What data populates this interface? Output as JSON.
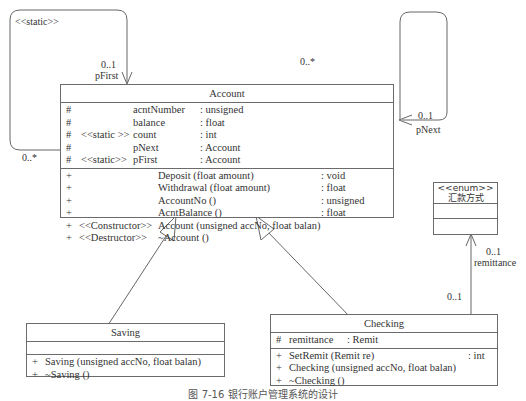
{
  "account": {
    "name": "Account",
    "attributes": [
      {
        "vis": "#",
        "stereo": "",
        "name": "acntNumber",
        "type": ": unsigned"
      },
      {
        "vis": "#",
        "stereo": "",
        "name": "balance",
        "type": ": float"
      },
      {
        "vis": "#",
        "stereo": "<<static >>",
        "name": "count",
        "type": ": int"
      },
      {
        "vis": "#",
        "stereo": "",
        "name": "pNext",
        "type": ": Account"
      },
      {
        "vis": "#",
        "stereo": "<<static>>",
        "name": "pFirst",
        "type": ": Account"
      }
    ],
    "operations": [
      {
        "vis": "+",
        "stereo": "",
        "name": "Deposit (float amount)",
        "type": ": void"
      },
      {
        "vis": "+",
        "stereo": "",
        "name": "Withdrawal (float amount)",
        "type": ": float"
      },
      {
        "vis": "+",
        "stereo": "",
        "name": "AccountNo ()",
        "type": ": unsigned"
      },
      {
        "vis": "+",
        "stereo": "",
        "name": "AcntBalance ()",
        "type": ": float"
      },
      {
        "vis": "+",
        "stereo": "<<Constructor>>",
        "name": "Account (unsigned  accNo, float balan)",
        "type": ""
      },
      {
        "vis": "+",
        "stereo": "<<Destructor>>",
        "name": "~Account ()",
        "type": ""
      }
    ]
  },
  "saving": {
    "name": "Saving",
    "operations": [
      {
        "vis": "+",
        "name": "Saving (unsigned  accNo, float balan)"
      },
      {
        "vis": "+",
        "name": "~Saving ()"
      }
    ]
  },
  "checking": {
    "name": "Checking",
    "attributes": [
      {
        "vis": "#",
        "name": "remittance",
        "type": ": Remit"
      }
    ],
    "operations": [
      {
        "vis": "+",
        "name": "SetRemit (Remit re)",
        "type": ": int"
      },
      {
        "vis": "+",
        "name": "Checking (unsigned accNo, float balan)",
        "type": ""
      },
      {
        "vis": "+",
        "name": "~Checking ()",
        "type": ""
      }
    ]
  },
  "enum": {
    "stereo": "<<enum>>",
    "name": "汇款方式"
  },
  "associations": {
    "static_label": "<<static>>",
    "pfirst_mult": "0..1",
    "pfirst_role": "pFirst",
    "pfirst_src_mult": "0..*",
    "pnext_src_mult": "0..*",
    "pnext_mult": "0..1",
    "pnext_role": "pNext",
    "remit_mult": "0..1",
    "remit_role": "remittance",
    "remit_src_mult": "0..1"
  },
  "caption": "图 7-16  银行账户管理系统的设计"
}
